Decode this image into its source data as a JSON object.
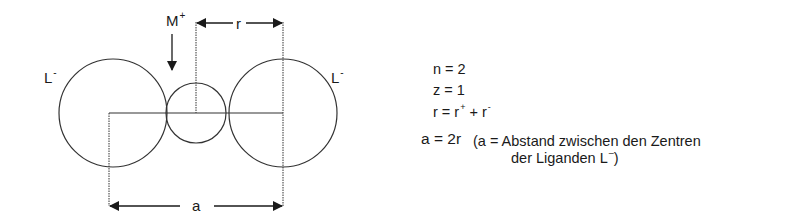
{
  "diagram": {
    "labels": {
      "cation": "M",
      "cation_charge": "+",
      "ligand_left": "L",
      "ligand_left_charge": "-",
      "ligand_right": "L",
      "ligand_right_charge": "-",
      "radius_label": "r",
      "distance_label": "a"
    },
    "geometry": {
      "ligand_left": {
        "cx": 113,
        "cy": 113,
        "r": 54
      },
      "cation": {
        "cx": 196,
        "cy": 113,
        "r": 30
      },
      "ligand_right": {
        "cx": 283,
        "cy": 113,
        "r": 54
      }
    }
  },
  "equations": {
    "n_line": "n = 2",
    "z_line": "z = 1",
    "r_line_prefix": "r =  r",
    "r_plus": "+",
    "r_mid": " + r",
    "r_minus": "-",
    "a_line": "a = 2r",
    "a_note_line1": "(a = Abstand zwischen den Zentren",
    "a_note_line2": "der Liganden L",
    "a_note_line2_charge": "–",
    "a_note_line2_close": ")"
  }
}
